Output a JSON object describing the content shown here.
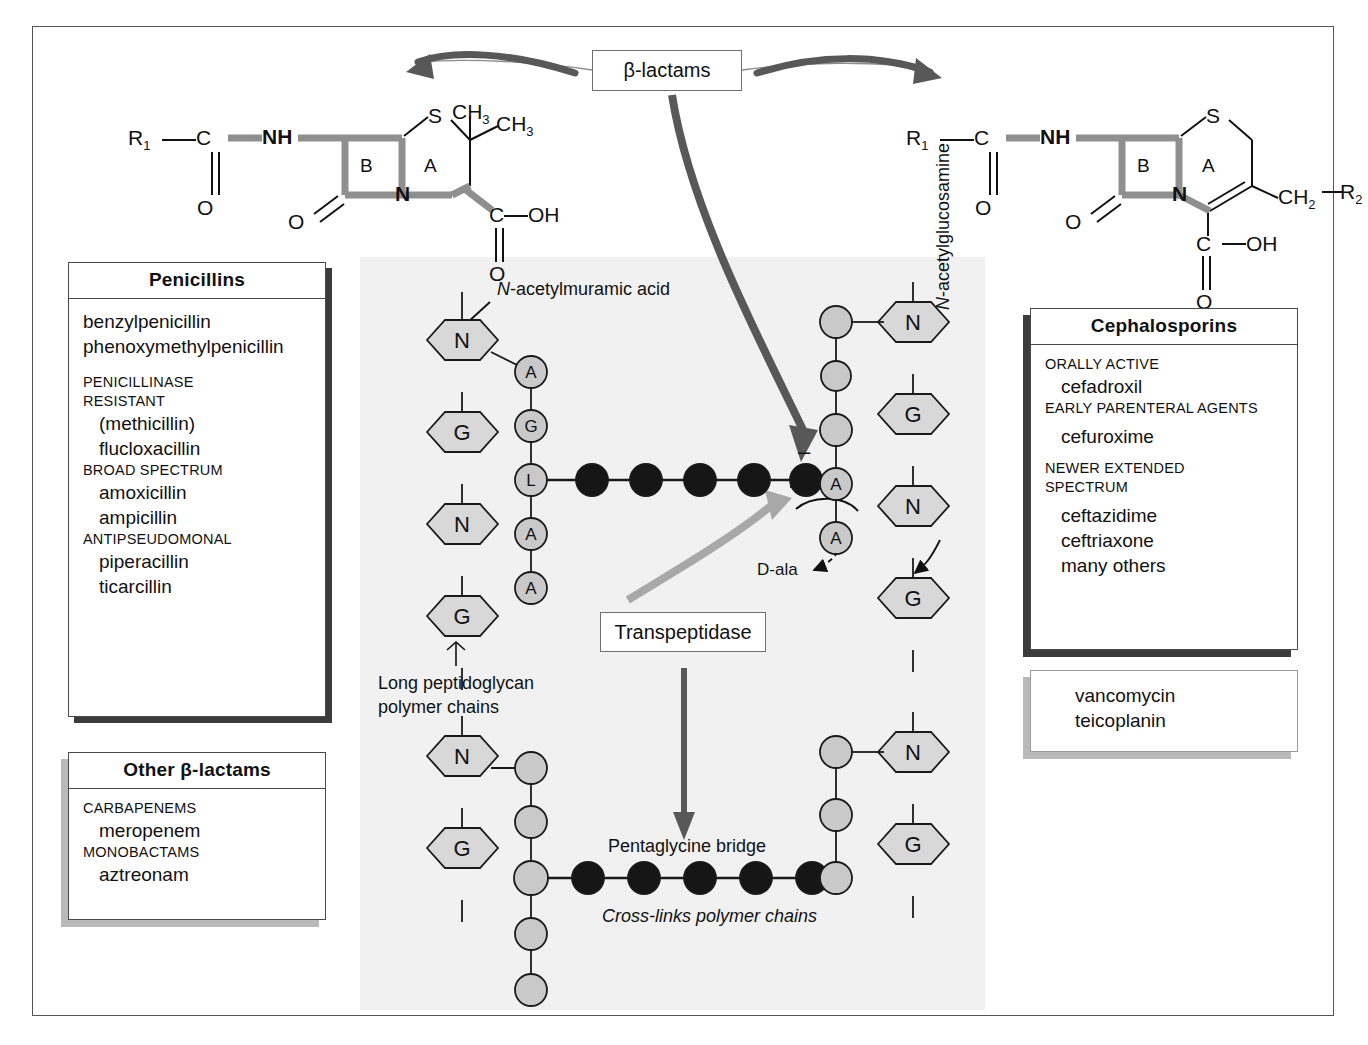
{
  "title_box": {
    "label": "β-lactams"
  },
  "transpeptidase_box": {
    "label": "Transpeptidase"
  },
  "penicillins": {
    "title": "Penicillins",
    "lines": [
      {
        "kind": "drug",
        "text": "benzylpenicillin"
      },
      {
        "kind": "drug",
        "text": "phenoxymethylpenicillin"
      },
      {
        "kind": "gap14",
        "text": ""
      },
      {
        "kind": "cat",
        "text": "PENICILLINASE"
      },
      {
        "kind": "cat",
        "text": "RESISTANT"
      },
      {
        "kind": "drugi",
        "text": "(methicillin)"
      },
      {
        "kind": "drugi",
        "text": "flucloxacillin"
      },
      {
        "kind": "cat",
        "text": "BROAD SPECTRUM"
      },
      {
        "kind": "drugi",
        "text": "amoxicillin"
      },
      {
        "kind": "drugi",
        "text": "ampicillin"
      },
      {
        "kind": "cat",
        "text": "ANTIPSEUDOMONAL"
      },
      {
        "kind": "drugi",
        "text": "piperacillin"
      },
      {
        "kind": "drugi",
        "text": "ticarcillin"
      }
    ]
  },
  "other_betalactams": {
    "title": "Other β-lactams",
    "lines": [
      {
        "kind": "cat",
        "text": "CARBAPENEMS"
      },
      {
        "kind": "drugi",
        "text": "meropenem"
      },
      {
        "kind": "cat",
        "text": "MONOBACTAMS"
      },
      {
        "kind": "drugi",
        "text": "aztreonam"
      }
    ]
  },
  "cephalosporins": {
    "title": "Cephalosporins",
    "lines": [
      {
        "kind": "cat",
        "text": "ORALLY ACTIVE"
      },
      {
        "kind": "drugi",
        "text": "cefadroxil"
      },
      {
        "kind": "cat",
        "text": "EARLY PARENTERAL AGENTS"
      },
      {
        "kind": "gap6",
        "text": ""
      },
      {
        "kind": "drugi",
        "text": "cefuroxime"
      },
      {
        "kind": "gap10",
        "text": ""
      },
      {
        "kind": "cat",
        "text": "NEWER EXTENDED"
      },
      {
        "kind": "cat",
        "text": "SPECTRUM"
      },
      {
        "kind": "gap6",
        "text": ""
      },
      {
        "kind": "drugi",
        "text": "ceftazidime"
      },
      {
        "kind": "drugi",
        "text": "ceftriaxone"
      },
      {
        "kind": "drugi",
        "text": "many others"
      }
    ]
  },
  "glycopeptides": {
    "lines": [
      {
        "kind": "drugi",
        "text": "vancomycin"
      },
      {
        "kind": "drugi",
        "text": "teicoplanin"
      }
    ]
  },
  "penicillin_structure": {
    "r1": "R",
    "r1sub": "1",
    "c": "C",
    "o_left": "O",
    "nh": "NH",
    "o_ring": "O",
    "n_ring": "N",
    "s": "S",
    "ring_b": "B",
    "ring_a": "A",
    "ch3_a": "CH",
    "ch3_a_sub": "3",
    "ch3_b": "CH",
    "ch3_b_sub": "3",
    "c_acid": "C",
    "oh": "OH",
    "o_acid": "O"
  },
  "cephalosporin_structure": {
    "r1": "R",
    "r1sub": "1",
    "c": "C",
    "o_left": "O",
    "nh": "NH",
    "o_ring": "O",
    "n_ring": "N",
    "s": "S",
    "ring_b": "B",
    "ring_a": "A",
    "ch2": "CH",
    "ch2_sub": "2",
    "r2": "R",
    "r2sub": "2",
    "c_acid": "C",
    "oh": "OH",
    "o_acid": "O"
  },
  "peptidoglycan": {
    "nam_label": "N-acetylmuramic acid",
    "nam_label_italic_prefix": "N",
    "nag_label": "N-acetylglucosamine",
    "long_chain_label_line1": "Long peptidoglycan",
    "long_chain_label_line2": "polymer chains",
    "pentaglycine_label": "Pentaglycine bridge",
    "crosslink_label": "Cross-links polymer chains",
    "dala_label": "D-ala",
    "minus_sign": "–",
    "top_left_sugars": [
      "N",
      "G",
      "N",
      "G"
    ],
    "top_left_peptide": [
      "A",
      "G",
      "L",
      "A",
      "A"
    ],
    "top_right_sugars": [
      "N",
      "G",
      "N",
      "G"
    ],
    "top_right_peptide": [
      "",
      "",
      "",
      "A",
      "A"
    ],
    "top_bridge_circles": 5,
    "bottom_left_sugars": [
      "N",
      "G"
    ],
    "bottom_left_peptide": [
      "",
      "",
      "",
      "",
      ""
    ],
    "bottom_right_sugars": [
      "N",
      "G"
    ],
    "bottom_right_peptide": [
      "",
      "",
      ""
    ],
    "bottom_bridge_circles": 5
  },
  "colors": {
    "panel_bg": "#f1f1f1",
    "sugar_fill": "#d8d8d8",
    "peptide_fill": "#c9c9c9",
    "bridge_fill": "#161616",
    "arrow_dark": "#585858",
    "arrow_light": "#a8a8a8",
    "highlight_bond": "#8f8f8f",
    "frame": "#555555"
  }
}
